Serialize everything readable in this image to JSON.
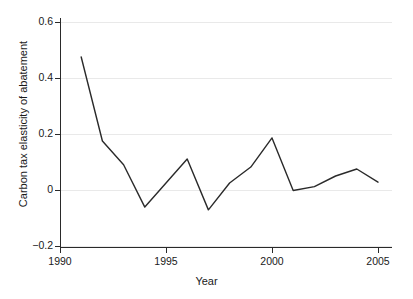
{
  "chart_data": {
    "type": "line",
    "title": "",
    "xlabel": "Year",
    "ylabel": "Carbon tax elasticity of abatement",
    "xlim": [
      1990.0,
      2005.6
    ],
    "ylim": [
      -0.22,
      0.63
    ],
    "grid": true,
    "legend": null,
    "x_ticks": [
      1990,
      1995,
      2000,
      2005
    ],
    "x_tick_labels": [
      "1990",
      "1995",
      "2000",
      "2005"
    ],
    "y_ticks": [
      -0.2,
      0,
      0.2,
      0.4,
      0.6
    ],
    "y_tick_labels": [
      "−0.2",
      "0",
      "0.2",
      "0.4",
      "0.6"
    ],
    "line_color": "#2a2a2a",
    "line_width": 1.4,
    "x": [
      1991,
      1992,
      1993,
      1994,
      1995,
      1996,
      1997,
      1998,
      1999,
      2000,
      2001,
      2002,
      2003,
      2004,
      2005
    ],
    "values": [
      0.475,
      0.175,
      0.09,
      -0.061,
      0.025,
      0.111,
      -0.071,
      0.025,
      0.082,
      0.186,
      -0.002,
      0.012,
      0.05,
      0.075,
      0.028
    ],
    "series": [
      {
        "name": "Carbon tax elasticity of abatement",
        "values": [
          0.475,
          0.175,
          0.09,
          -0.061,
          0.025,
          0.111,
          -0.071,
          0.025,
          0.082,
          0.186,
          -0.002,
          0.012,
          0.05,
          0.075,
          0.028
        ]
      }
    ]
  },
  "axes": {
    "x_title": "Year",
    "y_title": "Carbon tax elasticity of abatement",
    "x_tick_labels": [
      "1990",
      "1995",
      "2000",
      "2005"
    ],
    "y_tick_labels": [
      "0.6",
      "0.4",
      "0.2",
      "0",
      "−0.2"
    ]
  }
}
